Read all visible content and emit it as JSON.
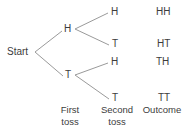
{
  "diagram": {
    "line_color": "#9a9a9a",
    "text_color": "#3c3c3c",
    "background": "#ffffff",
    "root": {
      "label": "Start"
    },
    "first_toss": [
      {
        "label": "H"
      },
      {
        "label": "T"
      }
    ],
    "second_toss": [
      {
        "label": "H"
      },
      {
        "label": "T"
      },
      {
        "label": "H"
      },
      {
        "label": "T"
      }
    ],
    "outcomes": [
      {
        "label": "HH"
      },
      {
        "label": "HT"
      },
      {
        "label": "TH"
      },
      {
        "label": "TT"
      }
    ],
    "column_headers": [
      {
        "line1": "First",
        "line2": "toss"
      },
      {
        "line1": "Second",
        "line2": "toss"
      },
      {
        "line1": "Outcome",
        "line2": ""
      }
    ]
  }
}
